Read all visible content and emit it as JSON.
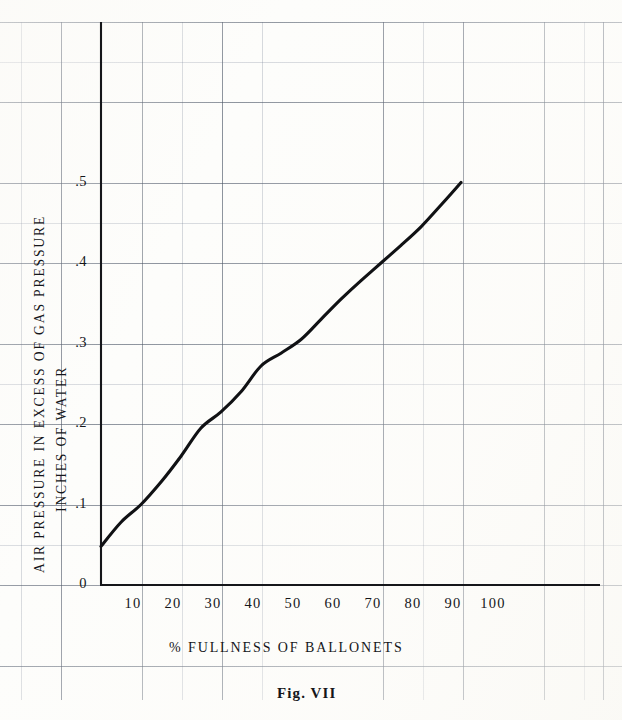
{
  "figure": {
    "caption": "Fig. VII"
  },
  "chart_data": {
    "type": "line",
    "title": "Fig. VII",
    "xlabel": "% FULLNESS OF BALLONETS",
    "ylabel_line1": "AIR PRESSURE IN EXCESS OF GAS PRESSURE",
    "ylabel_line2": "INCHES OF WATER",
    "xlim": [
      0,
      100
    ],
    "ylim": [
      0,
      0.5
    ],
    "grid": "graph-paper ruled, minor and major rulings",
    "legend": "none",
    "xticks": [
      10,
      20,
      30,
      40,
      50,
      60,
      70,
      80,
      90,
      100
    ],
    "xtick_labels": [
      "10",
      "20",
      "30",
      "40",
      "50",
      "60",
      "70",
      "80",
      "90",
      "100"
    ],
    "yticks": [
      0,
      0.1,
      0.2,
      0.3,
      0.4,
      0.5
    ],
    "ytick_labels": [
      "0",
      ".1",
      ".2",
      ".3",
      ".4",
      ".5"
    ],
    "series": [
      {
        "name": "air pressure in excess of gas pressure",
        "x": [
          0,
          5,
          10,
          15,
          20,
          25,
          30,
          35,
          40,
          45,
          50,
          55,
          60,
          65,
          70,
          75,
          80,
          85,
          90
        ],
        "y": [
          0.048,
          0.078,
          0.1,
          0.128,
          0.16,
          0.195,
          0.215,
          0.24,
          0.272,
          0.288,
          0.305,
          0.33,
          0.355,
          0.378,
          0.4,
          0.422,
          0.445,
          0.472,
          0.5
        ]
      }
    ],
    "annotations": [
      "Curve begins at about 0.048 inches of water at 0% fullness",
      "Slope breaks near 25% fullness then rises nearly linearly to 0.50 at 90% fullness"
    ]
  },
  "axes": {
    "y_label_line1": "AIR PRESSURE IN EXCESS OF GAS PRESSURE",
    "y_label_line2": "INCHES OF WATER",
    "x_label": "% FULLNESS OF BALLONETS",
    "y_ticks": [
      {
        "label": ".5",
        "value": 0.5
      },
      {
        "label": ".4",
        "value": 0.4
      },
      {
        "label": ".3",
        "value": 0.3
      },
      {
        "label": ".2",
        "value": 0.2
      },
      {
        "label": ".1",
        "value": 0.1
      },
      {
        "label": "0",
        "value": 0.0
      }
    ],
    "x_ticks": [
      {
        "label": "10",
        "value": 10
      },
      {
        "label": "20",
        "value": 20
      },
      {
        "label": "30",
        "value": 30
      },
      {
        "label": "40",
        "value": 40
      },
      {
        "label": "50",
        "value": 50
      },
      {
        "label": "60",
        "value": 60
      },
      {
        "label": "70",
        "value": 70
      },
      {
        "label": "80",
        "value": 80
      },
      {
        "label": "90",
        "value": 90
      },
      {
        "label": "100",
        "value": 100
      }
    ]
  },
  "colors": {
    "ink": "#15161a",
    "curve": "#101114",
    "grid_minor": "#7a8296",
    "grid_major": "#46505f",
    "paper": "#fdfdfb"
  }
}
